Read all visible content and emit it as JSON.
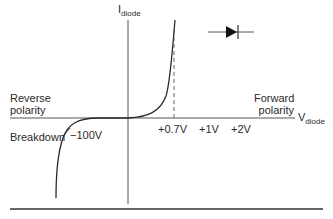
{
  "diagram": {
    "type": "diode-iv-characteristic",
    "y_axis_label": {
      "main": "I",
      "sub": "diode"
    },
    "x_axis_label": {
      "main": "V",
      "sub": "diode"
    },
    "region_labels": {
      "reverse": [
        "Reverse",
        "polarity"
      ],
      "forward": [
        "Forward",
        "polarity"
      ],
      "breakdown": "Breakdown"
    },
    "tick_labels": {
      "breakdown_voltage": "−100V",
      "threshold": "+0.7V",
      "one_volt": "+1V",
      "two_volt": "+2V"
    },
    "symbol": "diode-symbol",
    "colors": {
      "line": "#2a2a2a",
      "axis": "#555555",
      "dashed": "#555555"
    }
  }
}
